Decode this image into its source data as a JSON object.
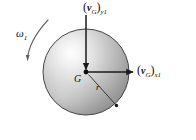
{
  "figure": {
    "type": "free-body-kinematics-diagram",
    "background_color": "#ffffff",
    "title": "",
    "labels": {
      "velocity_y": {
        "open_paren": "(",
        "symbol": "v",
        "point_subscript": "G",
        "close_paren": ")",
        "component_subscript": "y1",
        "full_text": "(vG)y1"
      },
      "velocity_x": {
        "open_paren": "(",
        "symbol": "v",
        "point_subscript": "G",
        "close_paren": ")",
        "component_subscript": "x1",
        "full_text": "(vG)x1"
      },
      "angular_velocity": {
        "symbol": "ω",
        "subscript": "1",
        "full_text": "ω1"
      },
      "center_of_mass": "G",
      "radius": "r"
    },
    "colors": {
      "sphere_highlight": "#fdfdfd",
      "sphere_midtone": "#c9c9c9",
      "sphere_shadow": "#8d8d8d",
      "sphere_outline": "#3a3a3a",
      "arrow": "#1a1a1a",
      "ground_line": "#8a8a8a",
      "text": "#111111"
    },
    "geometry": {
      "sphere_center_x": 86,
      "sphere_center_y": 72,
      "sphere_radius": 43,
      "ground_line_y": 125,
      "ground_line_x_start": 5,
      "ground_line_x_end": 191
    }
  }
}
